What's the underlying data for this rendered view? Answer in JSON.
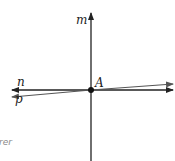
{
  "diagram": {
    "lines": [
      {
        "name": "m",
        "label": "m",
        "color": "#222222"
      },
      {
        "name": "n",
        "label": "n",
        "color": "#222222"
      },
      {
        "name": "p",
        "label": "p",
        "color": "#555555"
      }
    ],
    "point": {
      "label": "A",
      "color": "#111111"
    },
    "cutoff_text": "rer"
  }
}
